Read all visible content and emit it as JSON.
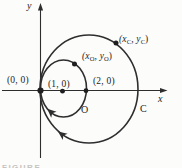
{
  "labels": {
    "y_axis": "y",
    "x_axis": "x",
    "origin": "(0, 0)",
    "small_center": "(1, 0)",
    "two_zero": "(2, 0)",
    "small_point": {
      "open": "(x",
      "sub1": "O",
      "mid": ", y",
      "sub2": "O",
      "close": ")"
    },
    "large_point": {
      "open": "(x",
      "sub1": "C",
      "mid": ", y",
      "sub2": "C",
      "close": ")"
    },
    "small_circle": "O",
    "large_circle": "C",
    "caption": "FIGURE"
  },
  "colors": {
    "ink": "#2e2e2e",
    "dot": "#1f1f1f",
    "text": "#1c1c1c",
    "background": "#fcfcfb",
    "caption": "#c7c4bf"
  },
  "geometry_notes": {
    "small_circle_center_label": "(1, 0)",
    "small_circle_through": [
      "(0, 0)",
      "(2, 0)"
    ],
    "direction_arrows": "both circles traversed clockwise (arrowheads at lower-left point up-left)"
  }
}
